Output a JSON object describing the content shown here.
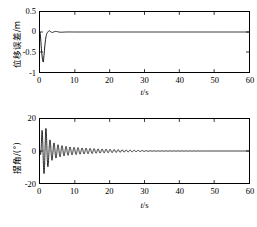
{
  "figure": {
    "kind": "two-panel-time-response",
    "background": "#ffffff",
    "line_color": "#000000"
  },
  "panels": {
    "top": {
      "ylabel": "位移误差/m",
      "xlabel_var": "t",
      "xlabel_unit": "/s",
      "xticks": [
        "0",
        "10",
        "20",
        "30",
        "40",
        "50",
        "60"
      ],
      "yticks": [
        "0.5",
        "0",
        "-0.5",
        "-1"
      ]
    },
    "bottom": {
      "ylabel": "摆角/(°)",
      "xlabel_var": "t",
      "xlabel_unit": "/s",
      "xticks": [
        "0",
        "10",
        "20",
        "30",
        "40",
        "50",
        "60"
      ],
      "yticks": [
        "20",
        "0",
        "-20"
      ]
    }
  },
  "chart_data": [
    {
      "type": "line",
      "id": "displacement-error",
      "title": "",
      "xlabel": "t/s",
      "ylabel": "位移误差/m",
      "xlim": [
        0,
        60
      ],
      "ylim": [
        -1,
        0.5
      ],
      "xticks": [
        0,
        10,
        20,
        30,
        40,
        50,
        60
      ],
      "yticks": [
        -1,
        -0.5,
        0,
        0.5
      ],
      "grid": false,
      "legend": null,
      "series": [
        {
          "name": "displacement error",
          "color": "#000000",
          "x": [
            0,
            0.15,
            0.3,
            0.45,
            0.6,
            0.75,
            0.9,
            1.0,
            1.1,
            1.25,
            1.4,
            1.55,
            1.7,
            1.85,
            2.0,
            2.2,
            2.4,
            2.6,
            2.8,
            3.0,
            3.2,
            3.4,
            3.6,
            3.8,
            4.0,
            4.3,
            4.6,
            5.0,
            5.4,
            5.8,
            6.2,
            6.8,
            7.5,
            8.5,
            10,
            12,
            15,
            20,
            25,
            30,
            35,
            40,
            45,
            50,
            55,
            60
          ],
          "y": [
            0.0,
            -0.12,
            -0.3,
            -0.47,
            -0.6,
            -0.7,
            -0.75,
            -0.72,
            -0.62,
            -0.48,
            -0.34,
            -0.22,
            -0.13,
            -0.07,
            -0.03,
            -0.005,
            0.015,
            0.03,
            0.025,
            0.012,
            0.0,
            -0.01,
            -0.012,
            -0.005,
            0.005,
            0.012,
            0.013,
            0.008,
            0.0,
            -0.005,
            -0.006,
            -0.003,
            0.0,
            0.001,
            0.0,
            0.0,
            0.0,
            0.0,
            0.0,
            0.0,
            0.0,
            0.0,
            0.0,
            0.0,
            0.0,
            0.0
          ]
        }
      ]
    },
    {
      "type": "line",
      "id": "swing-angle",
      "title": "",
      "xlabel": "t/s",
      "ylabel": "摆角/(°)",
      "xlim": [
        0,
        60
      ],
      "ylim": [
        -20,
        20
      ],
      "xticks": [
        0,
        10,
        20,
        30,
        40,
        50,
        60
      ],
      "yticks": [
        -20,
        0,
        20
      ],
      "grid": false,
      "legend": null,
      "description": "Damped oscillation, initial dip to about -13 deg, peak about +15 deg near t=1.6 s, decaying envelope reaching near zero by t=33 s, period about 1.15 s",
      "envelope": {
        "t": [
          0,
          0.6,
          1.6,
          2.6,
          3.6,
          5,
          7,
          9,
          12,
          16,
          20,
          25,
          30,
          33,
          60
        ],
        "amplitude": [
          0,
          13,
          15,
          7.5,
          5.5,
          4.0,
          3.0,
          2.4,
          1.9,
          1.4,
          1.0,
          0.6,
          0.25,
          0.08,
          0.0
        ]
      },
      "period_s": 1.15,
      "phase_offset_s": 0.0
    }
  ]
}
